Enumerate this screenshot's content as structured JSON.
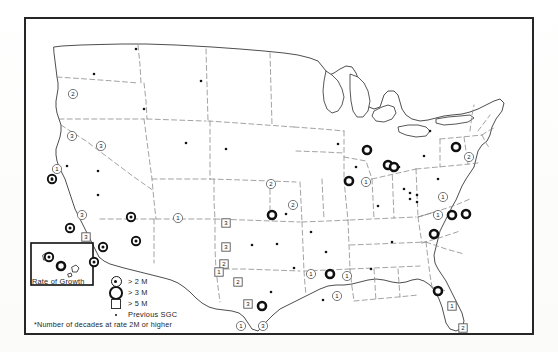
{
  "figure": {
    "type": "thematic-map",
    "region": "United States"
  },
  "legend": {
    "title": "Rate of Growth",
    "entries": [
      {
        "symbol": "circle-dot",
        "label": "> 2 M",
        "icon": "circle-with-center-dot-icon"
      },
      {
        "symbol": "circle-thick",
        "label": "> 3 M",
        "icon": "thick-ring-circle-icon"
      },
      {
        "symbol": "square",
        "label": "> 5 M",
        "icon": "open-square-icon"
      },
      {
        "symbol": "dot",
        "label": "Previous SGC",
        "icon": "small-dot-icon"
      }
    ],
    "footnote": "*Number of decades at rate 2M or higher"
  },
  "map": {
    "inset": {
      "name": "Hawaii",
      "label": ""
    },
    "markers": [
      {
        "id": "m01",
        "x": 47,
        "y": 75,
        "type": "circle-open",
        "label": "2"
      },
      {
        "id": "m02",
        "x": 46,
        "y": 117,
        "type": "circle-open",
        "label": "3"
      },
      {
        "id": "m03",
        "x": 31,
        "y": 150,
        "type": "circle-open",
        "label": "1"
      },
      {
        "id": "m04",
        "x": 26,
        "y": 160,
        "type": "circle-dot",
        "label": "1"
      },
      {
        "id": "m05",
        "x": 75,
        "y": 127,
        "type": "circle-open",
        "label": "3"
      },
      {
        "id": "m06",
        "x": 56,
        "y": 196,
        "type": "circle-open",
        "label": "3"
      },
      {
        "id": "m07",
        "x": 44,
        "y": 209,
        "type": "circle-dot",
        "label": ""
      },
      {
        "id": "m08",
        "x": 60,
        "y": 218,
        "type": "square",
        "label": "3"
      },
      {
        "id": "m09",
        "x": 77,
        "y": 228,
        "type": "circle-dot",
        "label": ""
      },
      {
        "id": "m10",
        "x": 68,
        "y": 243,
        "type": "circle-dot",
        "label": ""
      },
      {
        "id": "m11",
        "x": 105,
        "y": 198,
        "type": "circle-dot",
        "label": ""
      },
      {
        "id": "m12",
        "x": 110,
        "y": 222,
        "type": "circle-dot",
        "label": ""
      },
      {
        "id": "m13",
        "x": 23,
        "y": 238,
        "type": "circle-dot",
        "label": ""
      },
      {
        "id": "m14",
        "x": 152,
        "y": 199,
        "type": "circle-open",
        "label": "1"
      },
      {
        "id": "m15",
        "x": 200,
        "y": 204,
        "type": "square",
        "label": "3"
      },
      {
        "id": "m16",
        "x": 200,
        "y": 228,
        "type": "square",
        "label": "3"
      },
      {
        "id": "m17",
        "x": 198,
        "y": 245,
        "type": "square",
        "label": "2"
      },
      {
        "id": "m18",
        "x": 193,
        "y": 253,
        "type": "square",
        "label": "1"
      },
      {
        "id": "m19",
        "x": 212,
        "y": 263,
        "type": "square",
        "label": "2"
      },
      {
        "id": "m20",
        "x": 245,
        "y": 165,
        "type": "circle-open",
        "label": "2"
      },
      {
        "id": "m21",
        "x": 267,
        "y": 186,
        "type": "circle-open",
        "label": "2"
      },
      {
        "id": "m22",
        "x": 246,
        "y": 196,
        "type": "circle-thick",
        "label": ""
      },
      {
        "id": "m23",
        "x": 222,
        "y": 285,
        "type": "square",
        "label": "3"
      },
      {
        "id": "m24",
        "x": 236,
        "y": 287,
        "type": "circle-thick",
        "label": ""
      },
      {
        "id": "m25",
        "x": 215,
        "y": 307,
        "type": "circle-open",
        "label": "1"
      },
      {
        "id": "m26",
        "x": 237,
        "y": 307,
        "type": "circle-open",
        "label": "3"
      },
      {
        "id": "m27",
        "x": 285,
        "y": 255,
        "type": "circle-open",
        "label": "1"
      },
      {
        "id": "m28",
        "x": 304,
        "y": 255,
        "type": "circle-thick",
        "label": ""
      },
      {
        "id": "m29",
        "x": 321,
        "y": 257,
        "type": "circle-open",
        "label": "1"
      },
      {
        "id": "m30",
        "x": 311,
        "y": 277,
        "type": "circle-open",
        "label": "1"
      },
      {
        "id": "m31",
        "x": 341,
        "y": 131,
        "type": "circle-thick",
        "label": ""
      },
      {
        "id": "m32",
        "x": 362,
        "y": 146,
        "type": "circle-thick",
        "label": ""
      },
      {
        "id": "m33",
        "x": 368,
        "y": 148,
        "type": "circle-thick",
        "label": ""
      },
      {
        "id": "m34",
        "x": 323,
        "y": 162,
        "type": "circle-thick",
        "label": ""
      },
      {
        "id": "m35",
        "x": 340,
        "y": 163,
        "type": "circle-open",
        "label": "1"
      },
      {
        "id": "m36",
        "x": 430,
        "y": 128,
        "type": "circle-thick",
        "label": ""
      },
      {
        "id": "m37",
        "x": 443,
        "y": 138,
        "type": "circle-open",
        "label": "2"
      },
      {
        "id": "m38",
        "x": 417,
        "y": 178,
        "type": "circle-open",
        "label": "1"
      },
      {
        "id": "m39",
        "x": 412,
        "y": 196,
        "type": "circle-open",
        "label": "1"
      },
      {
        "id": "m40",
        "x": 426,
        "y": 196,
        "type": "circle-thick",
        "label": ""
      },
      {
        "id": "m41",
        "x": 440,
        "y": 195,
        "type": "circle-thick",
        "label": ""
      },
      {
        "id": "m42",
        "x": 408,
        "y": 215,
        "type": "circle-thick",
        "label": ""
      },
      {
        "id": "m43",
        "x": 412,
        "y": 272,
        "type": "circle-thick",
        "label": ""
      },
      {
        "id": "m44",
        "x": 426,
        "y": 287,
        "type": "square",
        "label": "1"
      },
      {
        "id": "m45",
        "x": 437,
        "y": 309,
        "type": "square",
        "label": "2"
      },
      {
        "id": "m46",
        "x": 35,
        "y": 247,
        "type": "circle-thick",
        "label": ""
      }
    ],
    "previous_sgc_dots": [
      {
        "x": 110,
        "y": 30
      },
      {
        "x": 68,
        "y": 55
      },
      {
        "x": 41,
        "y": 147
      },
      {
        "x": 72,
        "y": 152
      },
      {
        "x": 72,
        "y": 176
      },
      {
        "x": 175,
        "y": 62
      },
      {
        "x": 200,
        "y": 130
      },
      {
        "x": 226,
        "y": 226
      },
      {
        "x": 251,
        "y": 225
      },
      {
        "x": 260,
        "y": 195
      },
      {
        "x": 268,
        "y": 249
      },
      {
        "x": 285,
        "y": 213
      },
      {
        "x": 297,
        "y": 281
      },
      {
        "x": 245,
        "y": 273
      },
      {
        "x": 312,
        "y": 125
      },
      {
        "x": 330,
        "y": 148
      },
      {
        "x": 352,
        "y": 187
      },
      {
        "x": 373,
        "y": 148
      },
      {
        "x": 378,
        "y": 170
      },
      {
        "x": 384,
        "y": 174
      },
      {
        "x": 384,
        "y": 180
      },
      {
        "x": 391,
        "y": 176
      },
      {
        "x": 391,
        "y": 183
      },
      {
        "x": 398,
        "y": 137
      },
      {
        "x": 404,
        "y": 112
      },
      {
        "x": 412,
        "y": 160
      },
      {
        "x": 300,
        "y": 233
      },
      {
        "x": 345,
        "y": 250
      },
      {
        "x": 366,
        "y": 223
      },
      {
        "x": 160,
        "y": 124
      },
      {
        "x": 118,
        "y": 90
      }
    ]
  }
}
